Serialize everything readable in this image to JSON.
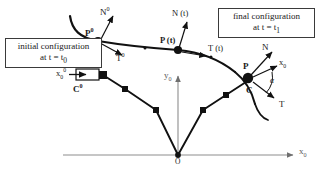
{
  "figure": {
    "title_role": "kinematics-of-a-moving-curve-diagram",
    "background": "#ffffff",
    "stroke": "#111111",
    "axis_color": "#8d8d8d"
  },
  "callouts": {
    "initial": {
      "line1": "initial configuration",
      "line2_prefix": "at t = t",
      "line2_sub": "0"
    },
    "final": {
      "line1": "final configuration",
      "line2_prefix": "at t = t",
      "line2_sub": "1"
    }
  },
  "labels": {
    "p0": {
      "base": "P",
      "sup": "0"
    },
    "n0": {
      "base": "N",
      "sup": "0"
    },
    "t0": {
      "base": "T",
      "sup": "0"
    },
    "p_t": {
      "text": "P (t)"
    },
    "n_t": {
      "text": "N (t)"
    },
    "t_t": {
      "text": "T (t)"
    },
    "p_final": {
      "text": "P"
    },
    "n_final": {
      "text": "N"
    },
    "t_final": {
      "text": "T"
    },
    "c_final": {
      "text": "C"
    },
    "c0": {
      "base": "C",
      "sup": "0"
    },
    "x0_vec": {
      "base": "x",
      "sub": "0",
      "sup": "0"
    },
    "x0_final": {
      "base": "x",
      "sub": "0"
    },
    "axis_x": {
      "base": "x",
      "sub": "0"
    },
    "axis_y": {
      "base": "y",
      "sub": "0"
    },
    "origin": {
      "text": "O"
    },
    "alpha": {
      "text": "α"
    }
  },
  "geometry": {
    "curve_initial_t0": "upper material curve at time t0 through node P0",
    "curve_final_t1": "lower material curve at time t1 through node P",
    "chord_polyline_nodes": 6,
    "origin_point": [
      233,
      155
    ],
    "x_axis_end": [
      296,
      155
    ],
    "y_axis_top": [
      178,
      74
    ]
  }
}
